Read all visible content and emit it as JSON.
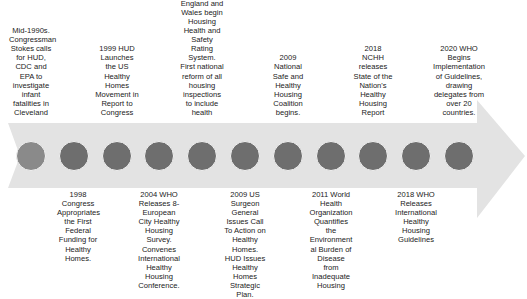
{
  "diagram": {
    "type": "timeline-arrow",
    "colors": {
      "arrow": "#e3e3e3",
      "dot": "#6e6e6e",
      "dot_first": "#8a8a8a",
      "text": "#222222"
    },
    "events": [
      {
        "position": "top",
        "x": 31,
        "text": "Mid-1990s. Congressman Stokes calls for HUD, CDC and EPA to investigate infant fatalities in Cleveland"
      },
      {
        "position": "bottom",
        "x": 74,
        "text": "1998 Congress Appropriates the First Federal Funding for Healthy Homes."
      },
      {
        "position": "top",
        "x": 117,
        "text": "1999 HUD Launches the US Healthy Homes Movement in Report to Congress"
      },
      {
        "position": "bottom",
        "x": 159,
        "text": "2004 WHO Releases 8-European City Healthy Housing Survey. Convenes International Healthy Housing Conference."
      },
      {
        "position": "top",
        "x": 202,
        "text": "2004 England and Wales begin Housing Health and Safety Rating System. First national reform of all housing inspections to include health"
      },
      {
        "position": "bottom",
        "x": 245,
        "text": "2009 US Surgeon General Issues Call To Action on Healthy Homes. HUD Issues Healthy Homes Strategic Plan."
      },
      {
        "position": "top",
        "x": 288,
        "text": "2009 National Safe and Healthy Housing Coalition begins."
      },
      {
        "position": "bottom",
        "x": 331,
        "text": "2011 World Health Organization Quantifies the Environment al Burden of Disease from Inadequate Housing"
      },
      {
        "position": "top",
        "x": 373,
        "text": "2018 NCHH releases State of the Nation's Healthy Housing Report"
      },
      {
        "position": "bottom",
        "x": 416,
        "text": "2018 WHO Releases International Healthy Housing Guidelines"
      },
      {
        "position": "top",
        "x": 459,
        "text": "2020 WHO Begins Implementation of Guidelines, drawing delegates from over 20 countries."
      }
    ]
  }
}
